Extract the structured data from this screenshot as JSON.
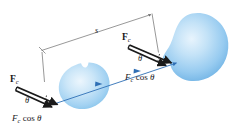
{
  "figure": {
    "name": "force-at-angle-work-diagram",
    "background_color": "#ffffff",
    "width": 233,
    "height": 138
  },
  "colors": {
    "blob_fill_outer": "#6fb3e4",
    "blob_fill_mid": "#a9d4f2",
    "blob_fill_inner": "#e2f1fc",
    "axis_blue": "#2f6fb5",
    "vector_black": "#1a1a1a",
    "dimension_gray": "#6b6b6b",
    "label_text": "#19181a"
  },
  "labels": {
    "left_force": {
      "symbol": "F",
      "subscript": "c"
    },
    "right_force": {
      "symbol": "F",
      "subscript": "c"
    },
    "left_angle": "θ",
    "right_angle": "θ",
    "left_component": {
      "symbol": "F",
      "subscript": "c",
      "rest": "cos",
      "angle": "θ"
    },
    "right_component": {
      "symbol": "F",
      "subscript": "c",
      "rest": "cos",
      "angle": "θ"
    },
    "distance": "s"
  },
  "elements": {
    "left_blob": "left-blue-blob",
    "right_blob": "right-blue-blob",
    "displacement_axis": "blue-displacement-axis-arrow",
    "left_vector": "left-force-vector-arrow",
    "left_component_vector": "left-horizontal-component-arrow",
    "left_vertical_leg": "left-triangle-vertical-leg",
    "right_vector": "right-force-vector-arrow",
    "right_component_vector": "right-horizontal-component-arrow",
    "right_vertical_leg": "right-triangle-vertical-leg",
    "dimension_line": "distance-dimension-line",
    "dimension_extension_left": "dimension-extension-line-left",
    "dimension_extension_right": "dimension-extension-line-right"
  }
}
